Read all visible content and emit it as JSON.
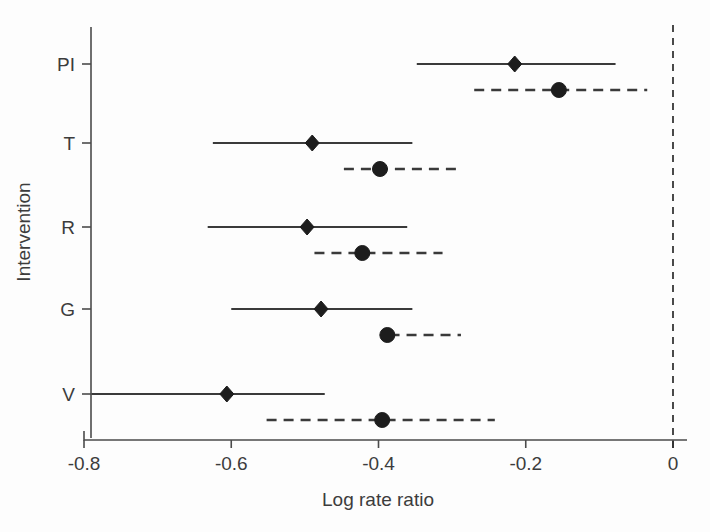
{
  "chart_data": {
    "type": "scatter",
    "title": "",
    "xlabel": "Log rate ratio",
    "ylabel": "Intervention",
    "xlim": [
      -0.83,
      0.02
    ],
    "xticks": [
      -0.8,
      -0.6,
      -0.4,
      -0.2,
      0
    ],
    "xtick_labels": [
      "-0.8",
      "-0.6",
      "-0.4",
      "-0.2",
      "0"
    ],
    "categories": [
      "PI",
      "T",
      "R",
      "G",
      "V"
    ],
    "grid": false,
    "legend": "none",
    "reference_line": 0,
    "reference_line_style": "dashed",
    "series": [
      {
        "name": "solid-diamond",
        "marker": "diamond",
        "linestyle": "solid",
        "values": [
          -0.215,
          -0.49,
          -0.497,
          -0.478,
          -0.606
        ],
        "ci_low": [
          -0.348,
          -0.625,
          -0.632,
          -0.6,
          -0.79
        ],
        "ci_high": [
          -0.078,
          -0.354,
          -0.361,
          -0.354,
          -0.473
        ]
      },
      {
        "name": "dashed-circle",
        "marker": "circle",
        "linestyle": "dashed",
        "values": [
          -0.155,
          -0.398,
          -0.422,
          -0.388,
          -0.395
        ],
        "ci_low": [
          -0.27,
          -0.447,
          -0.487,
          -0.385,
          -0.552
        ],
        "ci_high": [
          -0.035,
          -0.29,
          -0.313,
          -0.288,
          -0.242
        ]
      }
    ],
    "rows": [
      {
        "category": "PI",
        "solid": {
          "estimate": -0.215,
          "low": -0.348,
          "high": -0.078
        },
        "dashed": {
          "estimate": -0.155,
          "low": -0.27,
          "high": -0.035
        }
      },
      {
        "category": "T",
        "solid": {
          "estimate": -0.49,
          "low": -0.625,
          "high": -0.354
        },
        "dashed": {
          "estimate": -0.398,
          "low": -0.447,
          "high": -0.29
        }
      },
      {
        "category": "R",
        "solid": {
          "estimate": -0.497,
          "low": -0.632,
          "high": -0.361
        },
        "dashed": {
          "estimate": -0.422,
          "low": -0.487,
          "high": -0.313
        }
      },
      {
        "category": "G",
        "solid": {
          "estimate": -0.478,
          "low": -0.6,
          "high": -0.354
        },
        "dashed": {
          "estimate": -0.388,
          "low": -0.385,
          "high": -0.288
        }
      },
      {
        "category": "V",
        "solid": {
          "estimate": -0.606,
          "low": -0.79,
          "high": -0.473
        },
        "dashed": {
          "estimate": -0.395,
          "low": -0.552,
          "high": -0.242
        }
      }
    ]
  },
  "colors": {
    "ink": "#3a3a3a",
    "marker": "#1d1d1d",
    "background": "#fdfdfd"
  }
}
